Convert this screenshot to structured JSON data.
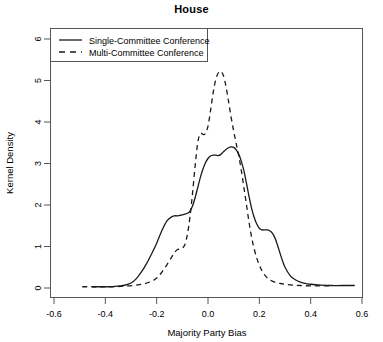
{
  "chart_data": {
    "type": "line",
    "title": "House",
    "xlabel": "Majority Party Bias",
    "ylabel": "Kernel Density",
    "xlim": [
      -0.6,
      0.6
    ],
    "ylim": [
      0,
      6
    ],
    "xticks": [
      -0.6,
      -0.4,
      -0.2,
      0.0,
      0.2,
      0.4,
      0.6
    ],
    "xticklabels": [
      "-0.6",
      "-0.4",
      "-0.2",
      "0.0",
      "0.2",
      "0.4",
      "0.6"
    ],
    "yticks": [
      0,
      1,
      2,
      3,
      4,
      5,
      6
    ],
    "yticklabels": [
      "0",
      "1",
      "2",
      "3",
      "4",
      "5",
      "6"
    ],
    "grid": false,
    "legend_position": "top-left",
    "series": [
      {
        "name": "Single-Committee Conference",
        "style": "solid",
        "color": "#1a1a1a",
        "x": [
          -0.45,
          -0.42,
          -0.39,
          -0.36,
          -0.33,
          -0.3,
          -0.28,
          -0.26,
          -0.24,
          -0.22,
          -0.2,
          -0.18,
          -0.16,
          -0.14,
          -0.13,
          -0.12,
          -0.11,
          -0.1,
          -0.09,
          -0.08,
          -0.07,
          -0.06,
          -0.05,
          -0.04,
          -0.03,
          -0.02,
          -0.01,
          0.0,
          0.01,
          0.02,
          0.03,
          0.04,
          0.05,
          0.06,
          0.07,
          0.08,
          0.09,
          0.1,
          0.11,
          0.12,
          0.13,
          0.14,
          0.15,
          0.16,
          0.17,
          0.18,
          0.19,
          0.2,
          0.21,
          0.22,
          0.23,
          0.24,
          0.25,
          0.26,
          0.27,
          0.28,
          0.29,
          0.3,
          0.32,
          0.34,
          0.36,
          0.38,
          0.4,
          0.44,
          0.48,
          0.52,
          0.57
        ],
        "y": [
          0.03,
          0.03,
          0.03,
          0.04,
          0.06,
          0.12,
          0.22,
          0.38,
          0.58,
          0.82,
          1.08,
          1.38,
          1.62,
          1.72,
          1.74,
          1.74,
          1.75,
          1.76,
          1.78,
          1.8,
          1.85,
          1.98,
          2.18,
          2.42,
          2.66,
          2.86,
          3.02,
          3.12,
          3.18,
          3.2,
          3.2,
          3.19,
          3.22,
          3.28,
          3.34,
          3.38,
          3.4,
          3.39,
          3.33,
          3.22,
          3.05,
          2.82,
          2.52,
          2.2,
          1.92,
          1.7,
          1.54,
          1.44,
          1.4,
          1.4,
          1.4,
          1.38,
          1.33,
          1.22,
          1.05,
          0.85,
          0.66,
          0.5,
          0.3,
          0.2,
          0.14,
          0.11,
          0.09,
          0.07,
          0.06,
          0.06,
          0.06
        ]
      },
      {
        "name": "Multi-Committee Conference",
        "style": "dashed",
        "color": "#1a1a1a",
        "x": [
          -0.49,
          -0.46,
          -0.43,
          -0.4,
          -0.37,
          -0.34,
          -0.31,
          -0.28,
          -0.25,
          -0.22,
          -0.2,
          -0.18,
          -0.16,
          -0.14,
          -0.13,
          -0.12,
          -0.11,
          -0.1,
          -0.09,
          -0.08,
          -0.07,
          -0.06,
          -0.05,
          -0.04,
          -0.03,
          -0.02,
          -0.01,
          0.0,
          0.01,
          0.02,
          0.03,
          0.04,
          0.05,
          0.06,
          0.07,
          0.08,
          0.09,
          0.1,
          0.11,
          0.12,
          0.13,
          0.14,
          0.15,
          0.16,
          0.17,
          0.18,
          0.19,
          0.2,
          0.21,
          0.22,
          0.23,
          0.24,
          0.26,
          0.28,
          0.3,
          0.33,
          0.36,
          0.4,
          0.44,
          0.48
        ],
        "y": [
          0.03,
          0.03,
          0.03,
          0.03,
          0.03,
          0.04,
          0.05,
          0.07,
          0.1,
          0.16,
          0.24,
          0.38,
          0.56,
          0.76,
          0.86,
          0.92,
          0.94,
          0.96,
          1.05,
          1.3,
          1.72,
          2.3,
          2.95,
          3.5,
          3.72,
          3.7,
          3.72,
          3.9,
          4.28,
          4.7,
          5.02,
          5.18,
          5.22,
          5.12,
          4.86,
          4.5,
          4.12,
          3.78,
          3.48,
          3.18,
          2.82,
          2.42,
          2.0,
          1.58,
          1.22,
          0.94,
          0.72,
          0.55,
          0.42,
          0.32,
          0.25,
          0.2,
          0.14,
          0.11,
          0.09,
          0.07,
          0.06,
          0.05,
          0.05,
          0.05
        ]
      }
    ]
  },
  "legend": {
    "items": [
      {
        "label": "Single-Committee Conference",
        "style": "solid"
      },
      {
        "label": "Multi-Committee Conference",
        "style": "dashed"
      }
    ]
  }
}
